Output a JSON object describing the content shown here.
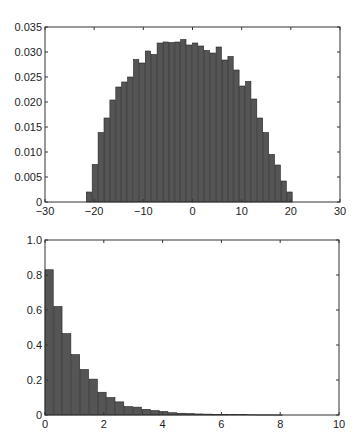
{
  "chart_data": [
    {
      "type": "bar",
      "title": "",
      "xlabel": "",
      "ylabel": "",
      "xlim": [
        -30,
        30
      ],
      "ylim": [
        0,
        0.035
      ],
      "grid": false,
      "xticks": [
        "-30",
        "-20",
        "-10",
        "0",
        "10",
        "20",
        "30"
      ],
      "yticks": [
        "0",
        "0.005",
        "0.010",
        "0.015",
        "0.020",
        "0.025",
        "0.030",
        "0.035"
      ],
      "bar_width": 1.2,
      "x": [
        -21.0,
        -19.8,
        -18.6,
        -17.4,
        -16.2,
        -15.0,
        -13.8,
        -12.6,
        -11.4,
        -10.2,
        -9.0,
        -7.8,
        -6.6,
        -5.4,
        -4.2,
        -3.0,
        -1.8,
        -0.6,
        0.6,
        1.8,
        3.0,
        4.2,
        5.4,
        6.6,
        7.8,
        9.0,
        10.2,
        11.4,
        12.6,
        13.8,
        15.0,
        16.2,
        17.4,
        18.6,
        19.8,
        21.0
      ],
      "values": [
        0.002,
        0.0075,
        0.0139,
        0.0168,
        0.0204,
        0.023,
        0.024,
        0.025,
        0.0285,
        0.0278,
        0.0302,
        0.0295,
        0.0318,
        0.032,
        0.0319,
        0.032,
        0.0325,
        0.0314,
        0.0318,
        0.0312,
        0.0303,
        0.0298,
        0.031,
        0.0284,
        0.0291,
        0.0264,
        0.0232,
        0.0241,
        0.0206,
        0.0168,
        0.0139,
        0.0095,
        0.0074,
        0.0042,
        0.002,
        0.0
      ]
    },
    {
      "type": "bar",
      "title": "",
      "xlabel": "",
      "ylabel": "",
      "xlim": [
        0,
        10
      ],
      "ylim": [
        0,
        1.0
      ],
      "grid": false,
      "xticks": [
        "0",
        "2",
        "4",
        "6",
        "8",
        "10"
      ],
      "yticks": [
        "0",
        "0.2",
        "0.4",
        "0.6",
        "0.8",
        "1.0"
      ],
      "bar_width": 0.3,
      "x": [
        0.15,
        0.45,
        0.75,
        1.05,
        1.35,
        1.65,
        1.95,
        2.25,
        2.55,
        2.85,
        3.15,
        3.45,
        3.75,
        4.05,
        4.35,
        4.65,
        4.95,
        5.25,
        5.55,
        5.85,
        6.15,
        6.45,
        6.75,
        7.05,
        7.35,
        7.65,
        7.95
      ],
      "values": [
        0.83,
        0.62,
        0.465,
        0.345,
        0.26,
        0.205,
        0.13,
        0.1,
        0.075,
        0.048,
        0.045,
        0.032,
        0.025,
        0.02,
        0.013,
        0.01,
        0.008,
        0.006,
        0.005,
        0.004,
        0.003,
        0.002,
        0.002,
        0.0015,
        0.001,
        0.001,
        0.0008
      ]
    }
  ]
}
